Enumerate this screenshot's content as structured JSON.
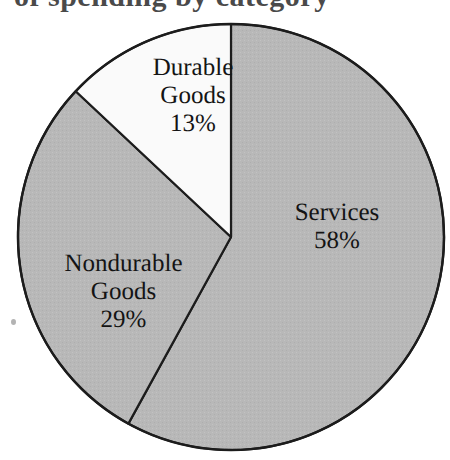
{
  "figure": {
    "background_color": "#ffffff",
    "title_remnant_text": "of spending by category",
    "title_visible": false,
    "scan_artifact": "ink-speck"
  },
  "chart_data": {
    "type": "pie",
    "title": "",
    "xlabel": "",
    "ylabel": "",
    "categories": [
      "Services",
      "Nondurable Goods",
      "Durable Goods"
    ],
    "values": [
      58,
      29,
      13
    ],
    "unit": "%",
    "legend": "none",
    "grid": false,
    "start_angle_deg": 0,
    "direction": "clockwise",
    "center": {
      "x": 231,
      "y": 237
    },
    "radius": 213,
    "outline_color": "#1c1c1c",
    "outline_width": 2,
    "slices": [
      {
        "label": "Services",
        "value": 58,
        "value_text": "58%",
        "fill": "#b8b8b8",
        "start_angle_deg": 0,
        "end_angle_deg": 208.8,
        "label_lines": [
          "Services"
        ]
      },
      {
        "label": "Nondurable Goods",
        "value": 29,
        "value_text": "29%",
        "fill": "#b8b8b8",
        "start_angle_deg": 208.8,
        "end_angle_deg": 313.2,
        "label_lines": [
          "Nondurable",
          "Goods"
        ]
      },
      {
        "label": "Durable Goods",
        "value": 13,
        "value_text": "13%",
        "fill": "#fafafa",
        "start_angle_deg": 313.2,
        "end_angle_deg": 360,
        "label_lines": [
          "Durable",
          "Goods"
        ]
      }
    ]
  },
  "labels": {
    "durable": {
      "line1": "Durable",
      "line2": "Goods",
      "pct": "13%"
    },
    "services": {
      "line1": "Services",
      "pct": "58%"
    },
    "nondurable": {
      "line1": "Nondurable",
      "line2": "Goods",
      "pct": "29%"
    }
  }
}
